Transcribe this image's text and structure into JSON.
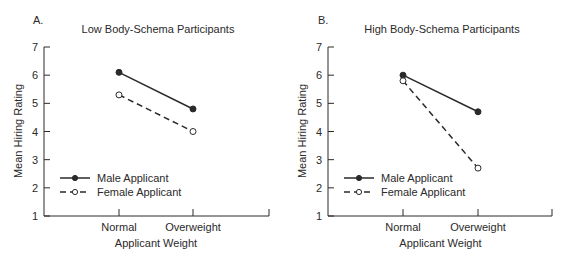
{
  "chart_data": [
    {
      "panel": "A.",
      "type": "line",
      "title": "Low Body-Schema Participants",
      "xlabel": "Applicant Weight",
      "ylabel": "Mean Hiring Rating",
      "categories": [
        "Normal",
        "Overweight"
      ],
      "yticks": [
        "1",
        "2",
        "3",
        "4",
        "5",
        "6",
        "7"
      ],
      "ylim": [
        1,
        7
      ],
      "grid": false,
      "legend_position": "lower-left",
      "series": [
        {
          "name": "Male Applicant",
          "style": "solid",
          "marker": "filled-circle",
          "values": [
            6.1,
            4.8
          ]
        },
        {
          "name": "Female Applicant",
          "style": "dashed",
          "marker": "open-circle",
          "values": [
            5.3,
            4.0
          ]
        }
      ]
    },
    {
      "panel": "B.",
      "type": "line",
      "title": "High Body-Schema Participants",
      "xlabel": "Applicant Weight",
      "ylabel": "Mean Hiring Rating",
      "categories": [
        "Normal",
        "Overweight"
      ],
      "yticks": [
        "1",
        "2",
        "3",
        "4",
        "5",
        "6",
        "7"
      ],
      "ylim": [
        1,
        7
      ],
      "grid": false,
      "legend_position": "lower-left",
      "series": [
        {
          "name": "Male Applicant",
          "style": "solid",
          "marker": "filled-circle",
          "values": [
            6.0,
            4.7
          ]
        },
        {
          "name": "Female Applicant",
          "style": "dashed",
          "marker": "open-circle",
          "values": [
            5.8,
            2.7
          ]
        }
      ]
    }
  ],
  "colors": {
    "ink": "#2a2a2a",
    "background": "#ffffff"
  }
}
